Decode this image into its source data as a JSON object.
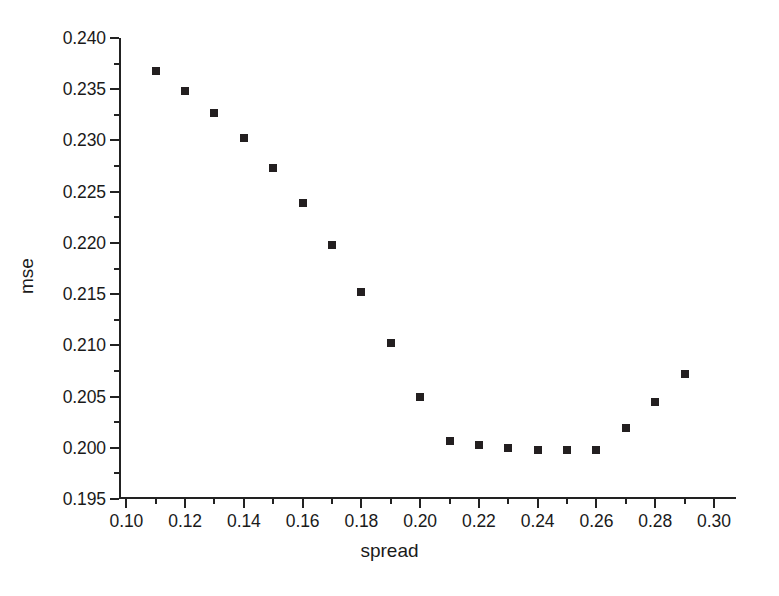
{
  "chart_data": {
    "type": "scatter",
    "title": "",
    "xlabel": "spread",
    "ylabel": "mse",
    "xlim": [
      0.0975,
      0.3075
    ],
    "ylim": [
      0.195,
      0.24
    ],
    "grid": false,
    "legend": "none",
    "marker": {
      "shape": "square",
      "color": "#231f20",
      "size_px": 8
    },
    "x_ticks_major": [
      0.1,
      0.12,
      0.14,
      0.16,
      0.18,
      0.2,
      0.22,
      0.24,
      0.26,
      0.28,
      0.3
    ],
    "x_tick_labels": [
      "0.10",
      "0.12",
      "0.14",
      "0.16",
      "0.18",
      "0.20",
      "0.22",
      "0.24",
      "0.26",
      "0.28",
      "0.30"
    ],
    "x_ticks_minor": [
      0.11,
      0.13,
      0.15,
      0.17,
      0.19,
      0.21,
      0.23,
      0.25,
      0.27,
      0.29
    ],
    "y_ticks_major": [
      0.195,
      0.2,
      0.205,
      0.21,
      0.215,
      0.22,
      0.225,
      0.23,
      0.235,
      0.24
    ],
    "y_tick_labels": [
      "0.195",
      "0.200",
      "0.205",
      "0.210",
      "0.215",
      "0.220",
      "0.225",
      "0.230",
      "0.235",
      "0.240"
    ],
    "y_ticks_minor": [
      0.1975,
      0.2025,
      0.2075,
      0.2125,
      0.2175,
      0.2225,
      0.2275,
      0.2325,
      0.2375
    ],
    "x": [
      0.11,
      0.12,
      0.13,
      0.14,
      0.15,
      0.16,
      0.17,
      0.18,
      0.19,
      0.2,
      0.21,
      0.22,
      0.23,
      0.24,
      0.25,
      0.26,
      0.27,
      0.28,
      0.29
    ],
    "values": [
      0.2368,
      0.2348,
      0.2327,
      0.2302,
      0.2273,
      0.2239,
      0.2198,
      0.2152,
      0.2102,
      0.205,
      0.2007,
      0.2003,
      0.2,
      0.1998,
      0.1998,
      0.1998,
      0.2019,
      0.2045,
      0.2072
    ]
  },
  "axes": {
    "x_title": "spread",
    "y_title": "mse"
  }
}
